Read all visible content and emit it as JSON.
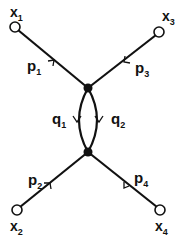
{
  "diagram": {
    "type": "feynman-box-like-diagram",
    "colors": {
      "line": "#111111",
      "background": "#ffffff",
      "external_point_fill": "#ffffff",
      "vertex_fill": "#111111"
    },
    "external_points": [
      {
        "id": "x1",
        "label": "x",
        "sub": "1"
      },
      {
        "id": "x2",
        "label": "x",
        "sub": "2"
      },
      {
        "id": "x3",
        "label": "x",
        "sub": "3"
      },
      {
        "id": "x4",
        "label": "x",
        "sub": "4"
      }
    ],
    "external_lines": [
      {
        "id": "p1",
        "label": "p",
        "sub": "1",
        "from": "x1",
        "to": "top_vertex"
      },
      {
        "id": "p2",
        "label": "p",
        "sub": "2",
        "from": "x2",
        "to": "bottom_vertex"
      },
      {
        "id": "p3",
        "label": "p",
        "sub": "3",
        "from": "x3",
        "to": "top_vertex"
      },
      {
        "id": "p4",
        "label": "p",
        "sub": "4",
        "from": "x4",
        "to": "bottom_vertex"
      }
    ],
    "internal_lines": [
      {
        "id": "q1",
        "label": "q",
        "sub": "1",
        "from": "top_vertex",
        "to": "bottom_vertex",
        "side": "left"
      },
      {
        "id": "q2",
        "label": "q",
        "sub": "2",
        "from": "top_vertex",
        "to": "bottom_vertex",
        "side": "right"
      }
    ],
    "vertices": [
      "top_vertex",
      "bottom_vertex"
    ]
  }
}
